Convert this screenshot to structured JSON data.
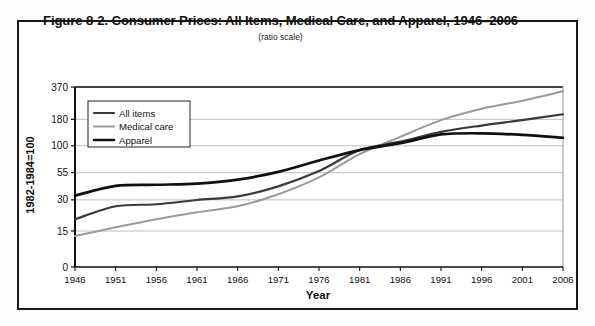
{
  "figure": {
    "title": "Figure 8-2. Consumer Prices: All Items, Medical Care, and Apparel, 1946–2006",
    "subtitle": "(ratio scale)"
  },
  "colors": {
    "all_items": "#3a3a3a",
    "medical_care": "#9a9a9a",
    "apparel": "#101010",
    "axis": "#111111",
    "grid": "#b8b8b8",
    "frame": "#1a1a1a",
    "background": "#ffffff"
  },
  "legend": {
    "position": "top-left-inside",
    "entries": [
      {
        "label": "All items",
        "color": "#3a3a3a",
        "width": 2.2
      },
      {
        "label": "Medical care",
        "color": "#9a9a9a",
        "width": 2.0
      },
      {
        "label": "Apparel",
        "color": "#101010",
        "width": 2.6
      }
    ]
  },
  "chart_data": {
    "type": "line",
    "title": "Figure 8-2. Consumer Prices: All Items, Medical Care, and Apparel, 1946–2006",
    "subtitle": "(ratio scale)",
    "xlabel": "Year",
    "ylabel": "1982-1984=100",
    "scale": "log",
    "grid": true,
    "legend_position": "top-left-inside",
    "xlim": [
      1946,
      2006
    ],
    "ylim": [
      15,
      370
    ],
    "x_ticks": [
      1946,
      1951,
      1956,
      1961,
      1966,
      1971,
      1976,
      1981,
      1986,
      1991,
      1996,
      2001,
      2006
    ],
    "x_tick_labels": [
      "1946",
      "1951",
      "1956",
      "1961",
      "1966",
      "1971",
      "1976",
      "1981",
      "1986",
      "1991",
      "1996",
      "2001",
      "2006"
    ],
    "y_ticks": [
      0,
      15,
      30,
      55,
      100,
      180,
      370
    ],
    "y_tick_labels": [
      "0",
      "15",
      "30",
      "55",
      "100",
      "180",
      "370"
    ],
    "x": [
      1946,
      1951,
      1956,
      1961,
      1966,
      1971,
      1976,
      1981,
      1986,
      1991,
      1996,
      2001,
      2006
    ],
    "series": [
      {
        "name": "All items",
        "color": "#3a3a3a",
        "values": [
          19.5,
          26.0,
          27.2,
          29.9,
          32.4,
          40.5,
          56.9,
          90.9,
          109.6,
          136.2,
          156.9,
          177.1,
          201.6
        ]
      },
      {
        "name": "Medical care",
        "color": "#9a9a9a",
        "values": [
          13.4,
          16.3,
          19.5,
          22.8,
          26.0,
          34.0,
          49.4,
          82.9,
          122.0,
          177.0,
          228.2,
          272.8,
          336.2
        ]
      },
      {
        "name": "Apparel",
        "color": "#101010",
        "values": [
          33.0,
          41.0,
          42.0,
          43.0,
          47.0,
          56.0,
          72.0,
          90.9,
          105.9,
          128.7,
          132.0,
          127.3,
          119.5
        ]
      }
    ]
  }
}
